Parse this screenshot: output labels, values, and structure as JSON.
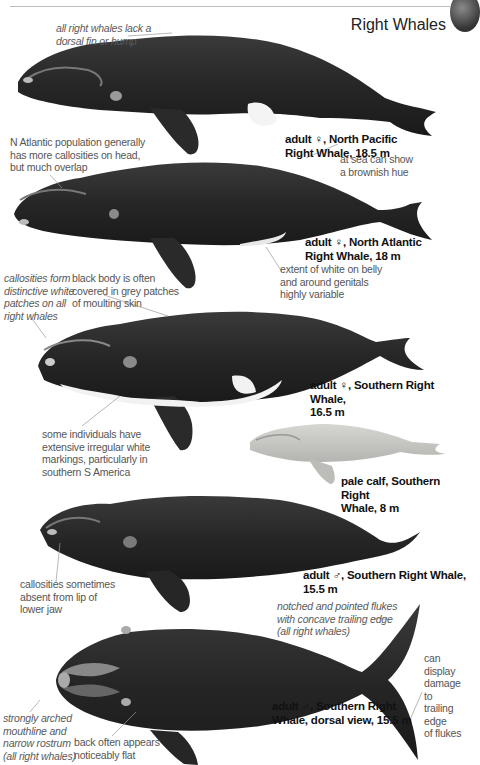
{
  "header": {
    "title": "Right Whales"
  },
  "plates": [
    {
      "caption_line1": "adult ♀, North Pacific",
      "caption_line2": "Right Whale, 18.5 m",
      "body_color": "#2a2a2a"
    },
    {
      "caption_line1": "adult ♀, North Atlantic",
      "caption_line2": "Right Whale, 18 m",
      "body_color": "#262626"
    },
    {
      "caption_line1": "adult ♀, Southern Right Whale,",
      "caption_line2": "16.5 m",
      "body_color": "#242424"
    },
    {
      "caption_line1": "pale calf, Southern Right",
      "caption_line2": "Whale, 8 m",
      "body_color": "#c8c8c4"
    },
    {
      "caption_line1": "adult ♂, Southern Right Whale,",
      "caption_line2": "15.5 m",
      "body_color": "#202020"
    },
    {
      "caption_line1": "adult ♂, Southern Right",
      "caption_line2": "Whale, dorsal view, 15.5 m",
      "body_color": "#1e1e1e"
    }
  ],
  "notes": {
    "no_fin": [
      "all right whales lack a",
      "dorsal fin or hump"
    ],
    "n_atlantic": [
      "N Atlantic population generally",
      "has more callosities on head,",
      "but much overlap"
    ],
    "brownish": [
      "at sea can show",
      "a brownish hue"
    ],
    "white_belly": [
      "extent of white on belly",
      "and around genitals",
      "highly variable"
    ],
    "callosities": [
      "callosities form",
      "distinctive white",
      "patches on all",
      "right whales"
    ],
    "grey_patches": [
      "black body is often",
      "covered in grey patches",
      "of moulting skin"
    ],
    "white_markings": [
      "some individuals have",
      "extensive irregular white",
      "markings, particularly in",
      "southern S America"
    ],
    "absent_lip": [
      "callosities sometimes",
      "absent from lip of",
      "lower jaw"
    ],
    "flukes": [
      "notched and pointed flukes",
      "with concave trailing edge",
      "(all right whales)"
    ],
    "damage": [
      "can display",
      "damage to",
      "trailing edge",
      "of flukes"
    ],
    "mouthline": [
      "strongly arched",
      "mouthline and",
      "narrow rostrum",
      "(all right whales)"
    ],
    "flat_back": [
      "back often appears",
      "noticeably flat"
    ]
  }
}
